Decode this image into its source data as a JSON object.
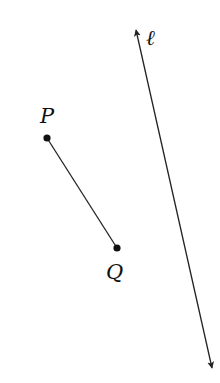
{
  "diagram": {
    "line": {
      "label": "ℓ",
      "start": [
        136,
        30
      ],
      "end": [
        212,
        368
      ],
      "arrows": "both",
      "color": "#222222"
    },
    "segment": {
      "from": "P",
      "to": "Q",
      "color": "#222222"
    },
    "points": [
      {
        "name": "P",
        "label": "P",
        "x": 47,
        "y": 138
      },
      {
        "name": "Q",
        "label": "Q",
        "x": 117,
        "y": 248
      }
    ]
  }
}
